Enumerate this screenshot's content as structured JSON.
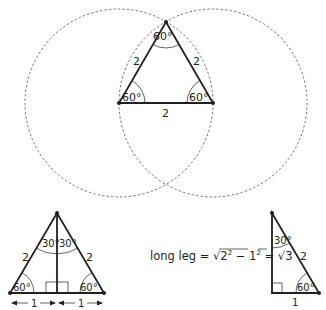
{
  "equilateral_construction": {
    "side_left": "2",
    "side_right": "2",
    "side_base": "2",
    "angle_top": "60°",
    "angle_left": "60°",
    "angle_right": "60°",
    "circle_count": 2
  },
  "bisected_triangle": {
    "side_left": "2",
    "side_right": "2",
    "angle_top_left": "30°",
    "angle_top_right": "30°",
    "angle_bottom_left": "60°",
    "angle_bottom_right": "60°",
    "half_base_left": "1",
    "half_base_right": "1"
  },
  "formula": {
    "prefix": "long leg = ",
    "radicand_a": "2",
    "exp_a": "2",
    "minus": " − ",
    "radicand_b": "1",
    "exp_b": "2",
    "equals": " = ",
    "result_radicand": "3"
  },
  "right_triangle": {
    "hypotenuse": "2",
    "short_leg": "1",
    "angle_top": "30°",
    "angle_bottom": "60°"
  },
  "colors": {
    "ink": "#231f20",
    "dashed": "#555555",
    "background": "#ffffff"
  }
}
